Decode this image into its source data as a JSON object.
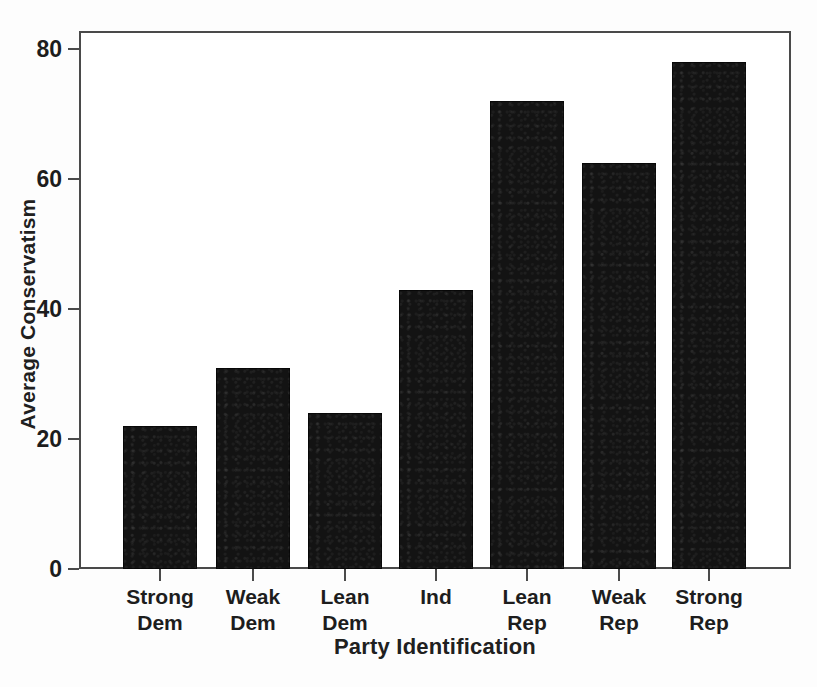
{
  "chart_data": {
    "type": "bar",
    "title": "",
    "xlabel": "Party Identification",
    "ylabel": "Average Conservatism",
    "categories": [
      "Strong Dem",
      "Weak Dem",
      "Lean Dem",
      "Ind",
      "Lean Rep",
      "Weak Rep",
      "Strong Rep"
    ],
    "category_lines": [
      [
        "Strong",
        "Dem"
      ],
      [
        "Weak",
        "Dem"
      ],
      [
        "Lean",
        "Dem"
      ],
      [
        "Ind",
        ""
      ],
      [
        "Lean",
        "Rep"
      ],
      [
        "Weak",
        "Rep"
      ],
      [
        "Strong",
        "Rep"
      ]
    ],
    "values": [
      22,
      31,
      24,
      43,
      72,
      62.5,
      78
    ],
    "ytick_labels": [
      "0",
      "20",
      "40",
      "60",
      "80"
    ],
    "ytick_values": [
      0,
      20,
      40,
      60,
      80
    ],
    "ylim": [
      0,
      82.5
    ],
    "grid": false,
    "legend": false,
    "bar_color": "#131313",
    "axis_color": "#4a4a4a",
    "text_color": "#1d1d1d",
    "background": "#ffffff"
  }
}
